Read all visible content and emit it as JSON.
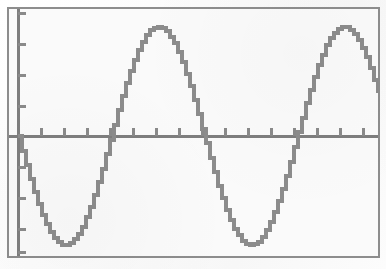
{
  "app": {
    "title": "Graphing Calculator Plot Screen",
    "device": "graphing-calculator",
    "screen_label": "Graph"
  },
  "colors": {
    "background": "#fafafa",
    "paper": "#fdfdfd",
    "frame": "#8d8d8d",
    "axis": "#7e7e7e",
    "tick": "#8a8a8a",
    "curve": "#8c8c8c"
  },
  "frame": {
    "left": 7,
    "top": 7,
    "width": 373,
    "height": 251,
    "border_width": 2
  },
  "chart_data": {
    "type": "line",
    "title": "",
    "subtitle": "",
    "xlabel": "",
    "ylabel": "",
    "legend": [],
    "legend_position": "none",
    "grid": false,
    "axes": {
      "x_axis_visible": true,
      "y_axis_visible": true,
      "x_axis_pixel_y": 127,
      "y_axis_pixel_x": 9,
      "xlim": [
        0,
        2.15
      ],
      "ylim": [
        -1,
        1
      ],
      "x_tick_interval": 0.125,
      "y_tick_interval": 0.25,
      "x_tick_count": 17,
      "y_tick_count": 8,
      "tick_length_px": 7
    },
    "series": [
      {
        "name": "sine",
        "expression": "y = -sin(2*pi*x)",
        "amplitude": 1,
        "period_px": 186,
        "phase": "starts at origin descending",
        "sample_count": 373,
        "x": [
          0,
          0.125,
          0.25,
          0.375,
          0.5,
          0.625,
          0.75,
          0.875,
          1,
          1.125,
          1.25,
          1.375,
          1.5,
          1.625,
          1.75,
          1.875,
          2,
          2.125
        ],
        "values": [
          0,
          -0.707,
          -1,
          -0.707,
          0,
          0.707,
          1,
          0.707,
          0,
          -0.707,
          -1,
          -0.707,
          0,
          0.707,
          1,
          0.707,
          0,
          -0.707
        ]
      }
    ],
    "annotations": [],
    "features": {
      "peaks": [
        {
          "x_px": 155,
          "y_px": 18,
          "value": 1
        },
        {
          "x_px": 341,
          "y_px": 18,
          "value": 1
        }
      ],
      "troughs": [
        {
          "x_px": 62,
          "y_px": 244,
          "value": -1
        },
        {
          "x_px": 248,
          "y_px": 244,
          "value": -1
        }
      ],
      "zero_crossings_px": [
        9,
        108,
        202,
        295,
        373
      ]
    }
  }
}
